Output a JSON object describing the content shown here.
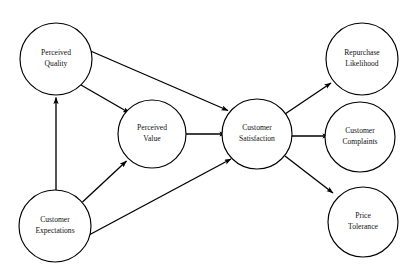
{
  "diagram": {
    "type": "path-diagram",
    "background_color": "#ffffff",
    "node_fill_color": "#ffffff",
    "node_stroke_color": "#000000",
    "edge_color": "#000000",
    "text_color": "#111111",
    "nodes": [
      {
        "id": "perceived-quality",
        "label_line1": "Perceived",
        "label_line2": "Quality",
        "cx": 56,
        "cy": 59,
        "r": 36
      },
      {
        "id": "customer-expectations",
        "label_line1": "Customer",
        "label_line2": "Expectations",
        "cx": 55,
        "cy": 226,
        "r": 36
      },
      {
        "id": "perceived-value",
        "label_line1": "Perceived",
        "label_line2": "Value",
        "cx": 152,
        "cy": 134,
        "r": 34
      },
      {
        "id": "customer-satisfaction",
        "label_line1": "Customer",
        "label_line2": "Satisfaction",
        "cx": 257,
        "cy": 134,
        "r": 35
      },
      {
        "id": "repurchase-likelihood",
        "label_line1": "Repurchase",
        "label_line2": "Likelihood",
        "cx": 362,
        "cy": 59,
        "r": 36
      },
      {
        "id": "customer-complaints",
        "label_line1": "Customer",
        "label_line2": "Complaints",
        "cx": 360,
        "cy": 137,
        "r": 35
      },
      {
        "id": "price-tolerance",
        "label_line1": "Price",
        "label_line2": "Tolerance",
        "cx": 363,
        "cy": 222,
        "r": 35
      }
    ],
    "edges": [
      {
        "id": "expectations-to-quality",
        "from": "customer-expectations",
        "to": "perceived-quality"
      },
      {
        "id": "expectations-to-value",
        "from": "customer-expectations",
        "to": "perceived-value"
      },
      {
        "id": "expectations-to-satisfaction",
        "from": "customer-expectations",
        "to": "customer-satisfaction"
      },
      {
        "id": "quality-to-value",
        "from": "perceived-quality",
        "to": "perceived-value"
      },
      {
        "id": "quality-to-satisfaction",
        "from": "perceived-quality",
        "to": "customer-satisfaction"
      },
      {
        "id": "value-to-satisfaction",
        "from": "perceived-value",
        "to": "customer-satisfaction"
      },
      {
        "id": "satisfaction-to-repurchase",
        "from": "customer-satisfaction",
        "to": "repurchase-likelihood"
      },
      {
        "id": "satisfaction-to-complaints",
        "from": "customer-satisfaction",
        "to": "customer-complaints"
      },
      {
        "id": "satisfaction-to-price-tolerance",
        "from": "customer-satisfaction",
        "to": "price-tolerance"
      }
    ]
  }
}
